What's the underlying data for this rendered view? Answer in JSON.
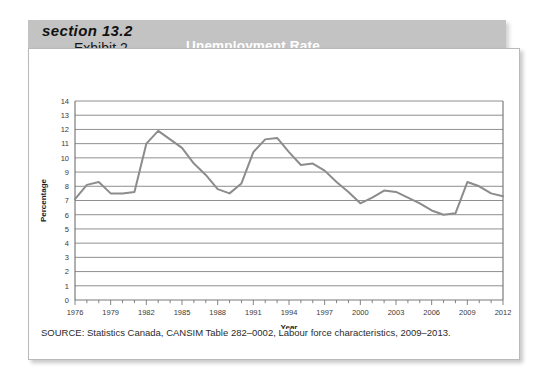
{
  "header": {
    "section_label": "section 13.2",
    "exhibit_label": "Exhibit 2",
    "chart_title": "Unemployment Rate",
    "banner_color": "#c3c3c3",
    "title_color": "#ffffff"
  },
  "source": {
    "text": "SOURCE: Statistics Canada, CANSIM Table 282–0002, Labour force characteristics, 2009–2013."
  },
  "chart_data": {
    "type": "line",
    "title": "Unemployment Rate",
    "xlabel": "Year",
    "ylabel": "Percentage",
    "xlim": [
      1976,
      2012
    ],
    "ylim": [
      0,
      14
    ],
    "ytick_step": 1,
    "xtick_labels": [
      "1976",
      "1979",
      "1982",
      "1985",
      "1988",
      "1991",
      "1994",
      "1997",
      "2000",
      "2003",
      "2006",
      "2009",
      "2012"
    ],
    "xtick_values": [
      1976,
      1979,
      1982,
      1985,
      1988,
      1991,
      1994,
      1997,
      2000,
      2003,
      2006,
      2009,
      2012
    ],
    "ytick_labels": [
      "0",
      "1",
      "2",
      "3",
      "4",
      "5",
      "6",
      "7",
      "8",
      "9",
      "10",
      "11",
      "12",
      "13",
      "14"
    ],
    "ytick_values": [
      0,
      1,
      2,
      3,
      4,
      5,
      6,
      7,
      8,
      9,
      10,
      11,
      12,
      13,
      14
    ],
    "grid": "horizontal",
    "legend": "none",
    "line_color": "#8c8c8c",
    "line_width": 2.0,
    "series": [
      {
        "name": "Unemployment Rate",
        "x": [
          1976,
          1977,
          1978,
          1979,
          1980,
          1981,
          1982,
          1983,
          1984,
          1985,
          1986,
          1987,
          1988,
          1989,
          1990,
          1991,
          1992,
          1993,
          1994,
          1995,
          1996,
          1997,
          1998,
          1999,
          2000,
          2001,
          2002,
          2003,
          2004,
          2005,
          2006,
          2007,
          2008,
          2009,
          2010,
          2011,
          2012
        ],
        "values": [
          7.1,
          8.1,
          8.3,
          7.5,
          7.5,
          7.6,
          11.0,
          11.9,
          11.3,
          10.7,
          9.6,
          8.8,
          7.8,
          7.5,
          8.2,
          10.4,
          11.3,
          11.4,
          10.4,
          9.5,
          9.6,
          9.1,
          8.3,
          7.6,
          6.8,
          7.2,
          7.7,
          7.6,
          7.2,
          6.8,
          6.3,
          6.0,
          6.1,
          8.3,
          8.0,
          7.5,
          7.3
        ]
      }
    ]
  }
}
